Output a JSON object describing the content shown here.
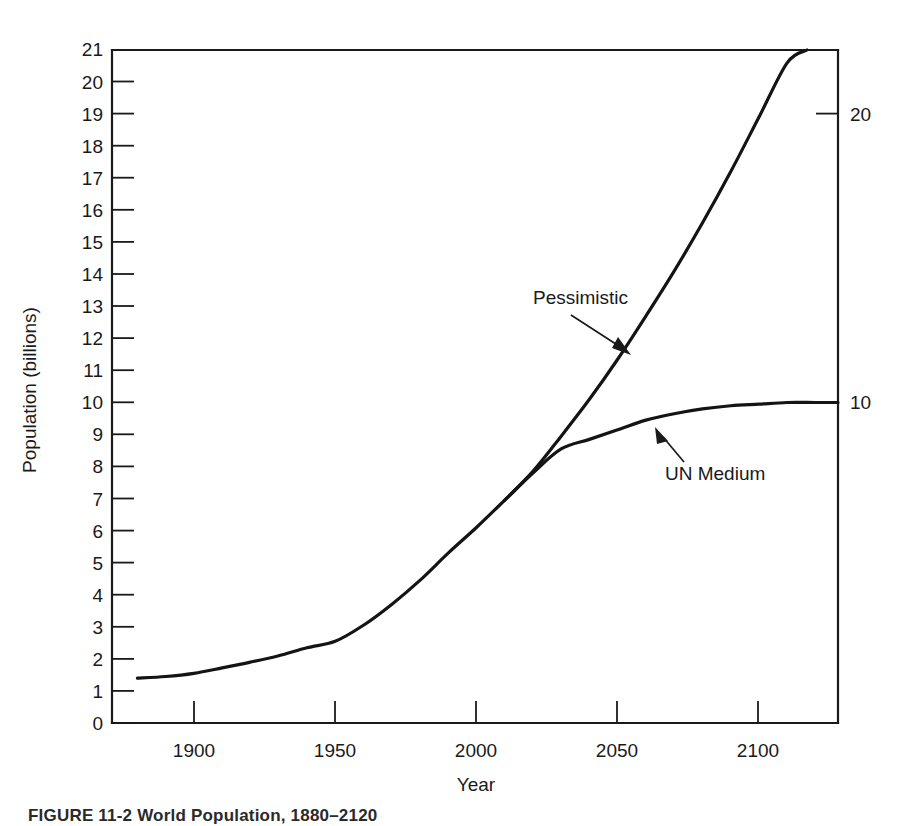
{
  "figure": {
    "caption": "FIGURE 11-2  World Population, 1880–2120"
  },
  "chart_data": {
    "type": "line",
    "title": "",
    "xlabel": "Year",
    "ylabel": "Population (billions)",
    "xlim": [
      1871,
      2128
    ],
    "ylim": [
      0,
      21
    ],
    "grid": false,
    "legend": "annotations-on-plot",
    "xticks": [
      1900,
      1950,
      2000,
      2050,
      2100
    ],
    "xtick_labels": [
      "1900",
      "1950",
      "2000",
      "2050",
      "2100"
    ],
    "yticks": [
      0,
      1,
      2,
      3,
      4,
      5,
      6,
      7,
      8,
      9,
      10,
      11,
      12,
      13,
      14,
      15,
      16,
      17,
      18,
      19,
      20,
      21
    ],
    "ytick_labels": [
      "0",
      "1",
      "2",
      "3",
      "4",
      "5",
      "6",
      "7",
      "8",
      "9",
      "10",
      "11",
      "12",
      "13",
      "14",
      "15",
      "16",
      "17",
      "18",
      "19",
      "20",
      "21"
    ],
    "right_axis_ticks": [
      10,
      20
    ],
    "right_axis_tick_labels": [
      "10",
      "20"
    ],
    "line_color": "#141414",
    "series": [
      {
        "name": "UN Medium",
        "annotation": "UN Medium",
        "x": [
          1880,
          1890,
          1900,
          1910,
          1920,
          1930,
          1940,
          1950,
          1960,
          1970,
          1980,
          1990,
          2000,
          2010,
          2020,
          2030,
          2040,
          2050,
          2060,
          2070,
          2080,
          2090,
          2100,
          2110,
          2120,
          2128
        ],
        "values": [
          1.4,
          1.45,
          1.55,
          1.72,
          1.9,
          2.1,
          2.35,
          2.55,
          3.05,
          3.7,
          4.45,
          5.3,
          6.1,
          6.95,
          7.8,
          8.55,
          8.85,
          9.15,
          9.45,
          9.65,
          9.8,
          9.9,
          9.95,
          10.0,
          10.0,
          10.0
        ]
      },
      {
        "name": "Pessimistic",
        "annotation": "Pessimistic",
        "x": [
          2010,
          2020,
          2030,
          2040,
          2050,
          2060,
          2070,
          2080,
          2090,
          2100,
          2110,
          2117
        ],
        "values": [
          6.95,
          7.85,
          8.95,
          10.1,
          11.35,
          12.7,
          14.1,
          15.6,
          17.2,
          18.9,
          20.6,
          21.0
        ]
      }
    ],
    "annotations": [
      {
        "text": "Pessimistic",
        "label_x": 533,
        "label_y": 304,
        "arrow_from_x": 571,
        "arrow_from_y": 315,
        "arrow_to_x": 628,
        "arrow_to_y": 353
      },
      {
        "text": "UN Medium",
        "label_x": 665,
        "label_y": 475,
        "arrow_from_x": 684,
        "arrow_from_y": 460,
        "arrow_to_x": 655,
        "arrow_to_y": 428
      }
    ]
  }
}
